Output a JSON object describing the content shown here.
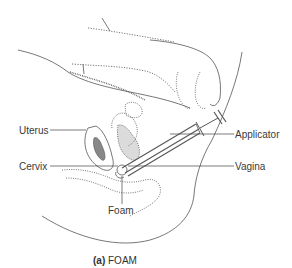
{
  "figure": {
    "labels": {
      "uterus": "Uterus",
      "cervix": "Cervix",
      "foam": "Foam",
      "applicator": "Applicator",
      "vagina": "Vagina"
    },
    "caption": {
      "marker": "(a)",
      "text": "FOAM"
    }
  },
  "colors": {
    "line": "#4a4a4a",
    "text": "#3a3a3a",
    "background": "#ffffff"
  }
}
